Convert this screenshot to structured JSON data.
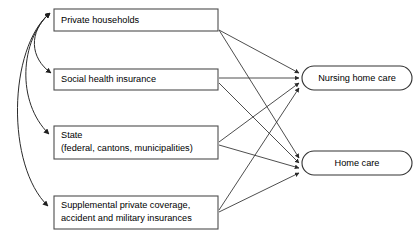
{
  "diagram": {
    "type": "flow-diagram",
    "title": "",
    "background_color": "#ffffff",
    "line_color": "#3a3a3a",
    "box_stroke_color": "#4d4d4d",
    "text_color": "#000000",
    "sources": [
      {
        "id": "private-households",
        "shape": "rectangle",
        "lines": [
          "Private households"
        ],
        "line1": "Private households",
        "line2": ""
      },
      {
        "id": "social-health-insurance",
        "shape": "rectangle",
        "lines": [
          "Social health insurance"
        ],
        "line1": "Social health insurance",
        "line2": ""
      },
      {
        "id": "state",
        "shape": "rectangle",
        "lines": [
          "State",
          "(federal, cantons, municipalities)"
        ],
        "line1": "State",
        "line2": "(federal, cantons, municipalities)"
      },
      {
        "id": "supplemental-private-coverage",
        "shape": "rectangle",
        "lines": [
          "Supplemental private coverage,",
          "accident and military insurances"
        ],
        "line1": "Supplemental private coverage,",
        "line2": "accident and military insurances"
      }
    ],
    "targets": [
      {
        "id": "nursing-home-care",
        "shape": "stadium",
        "label": "Nursing home care"
      },
      {
        "id": "home-care",
        "shape": "stadium",
        "label": "Home care"
      }
    ],
    "edges": {
      "funding_flows": [
        {
          "from": "private-households",
          "to": "nursing-home-care"
        },
        {
          "from": "private-households",
          "to": "home-care"
        },
        {
          "from": "social-health-insurance",
          "to": "nursing-home-care"
        },
        {
          "from": "social-health-insurance",
          "to": "home-care"
        },
        {
          "from": "state",
          "to": "nursing-home-care"
        },
        {
          "from": "state",
          "to": "home-care"
        },
        {
          "from": "supplemental-private-coverage",
          "to": "nursing-home-care"
        },
        {
          "from": "supplemental-private-coverage",
          "to": "home-care"
        }
      ],
      "curved_links": [
        {
          "between": "private-households",
          "and": "social-health-insurance",
          "style": "double-headed-curve"
        },
        {
          "between": "private-households",
          "and": "state",
          "style": "double-headed-curve"
        },
        {
          "between": "private-households",
          "and": "supplemental-private-coverage",
          "style": "double-headed-curve"
        }
      ]
    }
  }
}
